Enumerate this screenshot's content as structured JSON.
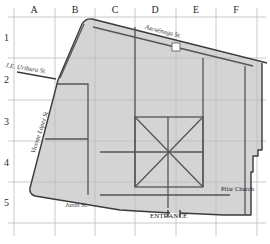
{
  "map": {
    "columns": [
      "A",
      "B",
      "C",
      "D",
      "E",
      "F"
    ],
    "rows": [
      "1",
      "2",
      "3",
      "4",
      "5"
    ],
    "streets": {
      "north": "Azcuénaga St.",
      "northwest": "J.E. Uriburu St.",
      "west": "Vicente López St.",
      "south": "Junín St."
    },
    "landmarks": {
      "entrance": "ENTRANCE",
      "church": "Pilar Church"
    },
    "colors": {
      "block_fill": "#d4d4d4",
      "outline": "#3a3a3a",
      "path": "#555555",
      "grid": "#bdbdbd"
    }
  }
}
